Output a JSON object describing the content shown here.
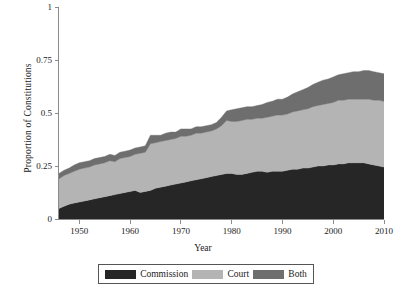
{
  "chart_data": {
    "type": "area",
    "stacked": true,
    "title": "",
    "xlabel": "Year",
    "ylabel": "Proportion of Constitutions",
    "xlim": [
      1946,
      2010
    ],
    "ylim": [
      0,
      1
    ],
    "xticks": [
      1950,
      1960,
      1970,
      1980,
      1990,
      2000,
      2010
    ],
    "xtick_labels": [
      "1950",
      "1960",
      "1970",
      "1980",
      "1990",
      "2000",
      "2010"
    ],
    "yticks": [
      0,
      0.25,
      0.5,
      0.75,
      1
    ],
    "ytick_labels": [
      "0",
      "0.25",
      "0.5",
      "0.75",
      "1"
    ],
    "grid": false,
    "legend_position": "bottom",
    "colors": {
      "commission": "#262626",
      "court": "#b4b4b4",
      "both": "#6e6e6e",
      "axis": "#808080",
      "text": "#1a1a1a",
      "background": "#ffffff",
      "legend_border": "#555555"
    },
    "x": [
      1946,
      1947,
      1948,
      1949,
      1950,
      1951,
      1952,
      1953,
      1954,
      1955,
      1956,
      1957,
      1958,
      1959,
      1960,
      1961,
      1962,
      1963,
      1964,
      1965,
      1966,
      1967,
      1968,
      1969,
      1970,
      1971,
      1972,
      1973,
      1974,
      1975,
      1976,
      1977,
      1978,
      1979,
      1980,
      1981,
      1982,
      1983,
      1984,
      1985,
      1986,
      1987,
      1988,
      1989,
      1990,
      1991,
      1992,
      1993,
      1994,
      1995,
      1996,
      1997,
      1998,
      1999,
      2000,
      2001,
      2002,
      2003,
      2004,
      2005,
      2006,
      2007,
      2008,
      2009,
      2010
    ],
    "series": [
      {
        "name": "Commission",
        "key": "commission",
        "color": "#262626",
        "values": [
          0.05,
          0.06,
          0.07,
          0.075,
          0.08,
          0.085,
          0.09,
          0.095,
          0.1,
          0.105,
          0.11,
          0.115,
          0.12,
          0.125,
          0.13,
          0.135,
          0.125,
          0.13,
          0.135,
          0.145,
          0.15,
          0.155,
          0.16,
          0.165,
          0.17,
          0.175,
          0.18,
          0.185,
          0.19,
          0.195,
          0.2,
          0.205,
          0.21,
          0.215,
          0.215,
          0.21,
          0.21,
          0.215,
          0.22,
          0.225,
          0.225,
          0.22,
          0.225,
          0.225,
          0.225,
          0.23,
          0.235,
          0.235,
          0.24,
          0.24,
          0.245,
          0.25,
          0.25,
          0.255,
          0.255,
          0.26,
          0.26,
          0.265,
          0.265,
          0.265,
          0.265,
          0.26,
          0.255,
          0.25,
          0.245
        ]
      },
      {
        "name": "Court",
        "key": "court",
        "color": "#b4b4b4",
        "values": [
          0.14,
          0.145,
          0.145,
          0.15,
          0.155,
          0.155,
          0.155,
          0.16,
          0.16,
          0.16,
          0.165,
          0.155,
          0.165,
          0.165,
          0.165,
          0.17,
          0.185,
          0.185,
          0.22,
          0.215,
          0.215,
          0.215,
          0.215,
          0.215,
          0.22,
          0.215,
          0.215,
          0.22,
          0.215,
          0.215,
          0.215,
          0.22,
          0.23,
          0.25,
          0.245,
          0.25,
          0.255,
          0.255,
          0.25,
          0.25,
          0.25,
          0.26,
          0.26,
          0.265,
          0.265,
          0.265,
          0.27,
          0.275,
          0.275,
          0.28,
          0.285,
          0.285,
          0.29,
          0.29,
          0.295,
          0.3,
          0.3,
          0.3,
          0.3,
          0.3,
          0.3,
          0.305,
          0.305,
          0.31,
          0.31
        ]
      },
      {
        "name": "Both",
        "key": "both",
        "color": "#6e6e6e",
        "values": [
          0.025,
          0.025,
          0.025,
          0.03,
          0.03,
          0.03,
          0.03,
          0.03,
          0.03,
          0.03,
          0.03,
          0.03,
          0.03,
          0.03,
          0.03,
          0.03,
          0.03,
          0.03,
          0.04,
          0.035,
          0.03,
          0.035,
          0.035,
          0.03,
          0.035,
          0.035,
          0.03,
          0.03,
          0.03,
          0.03,
          0.03,
          0.03,
          0.04,
          0.045,
          0.055,
          0.06,
          0.06,
          0.06,
          0.06,
          0.06,
          0.065,
          0.07,
          0.07,
          0.075,
          0.075,
          0.08,
          0.085,
          0.09,
          0.095,
          0.1,
          0.105,
          0.11,
          0.115,
          0.115,
          0.12,
          0.12,
          0.125,
          0.125,
          0.13,
          0.13,
          0.135,
          0.135,
          0.135,
          0.13,
          0.13
        ]
      }
    ]
  },
  "legend": {
    "entries": [
      {
        "label": "Commission",
        "color": "#262626"
      },
      {
        "label": "Court",
        "color": "#b4b4b4"
      },
      {
        "label": "Both",
        "color": "#6e6e6e"
      }
    ]
  }
}
